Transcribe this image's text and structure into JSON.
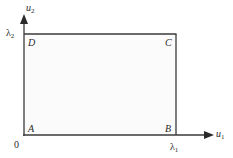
{
  "diagram": {
    "axes": {
      "x_label": "u",
      "x_label_sub": "1",
      "y_label": "u",
      "y_label_sub": "2",
      "origin": "0",
      "x_tick": "λ",
      "x_tick_sub": "1",
      "y_tick": "λ",
      "y_tick_sub": "2"
    },
    "corners": {
      "A": "A",
      "B": "B",
      "C": "C",
      "D": "D"
    },
    "colors": {
      "line": "#3a3a3a",
      "text": "#2a2a2a",
      "background": "#ffffff"
    }
  }
}
